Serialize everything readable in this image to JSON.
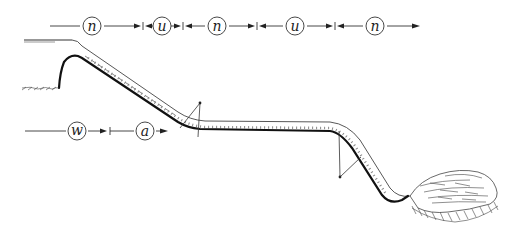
{
  "diagram": {
    "top_axis": {
      "zones": [
        {
          "label": "n",
          "cx": 92
        },
        {
          "label": "u",
          "cx": 162
        },
        {
          "label": "n",
          "cx": 217
        },
        {
          "label": "u",
          "cx": 295
        },
        {
          "label": "n",
          "cx": 375
        }
      ]
    },
    "bottom_axis": {
      "zones": [
        {
          "label": "w",
          "cx": 77
        },
        {
          "label": "a",
          "cx": 145
        }
      ]
    }
  }
}
